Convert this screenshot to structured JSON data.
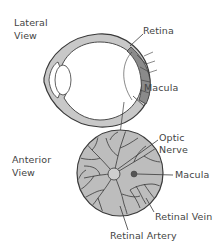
{
  "lateral_view": {
    "title_line1": "Lateral",
    "title_line2": "View",
    "labels": {
      "retina": "Retina",
      "macula": "Macula"
    }
  },
  "anterior_view": {
    "title_line1": "Anterior",
    "title_line2": "View",
    "labels": {
      "optic_line1": "Optic",
      "optic_line2": "Nerve",
      "macula": "Macula",
      "retinal_vein": "Retinal Vein",
      "retinal_artery": "Retinal Artery"
    }
  },
  "colors": {
    "outline": "#3a3a3a",
    "sclera_fill": "#c8c8c8",
    "retina_fill": "#8a8a8a",
    "fundus_fill": "#bdbdbd",
    "macula_dot": "#555555",
    "text": "#444444"
  }
}
